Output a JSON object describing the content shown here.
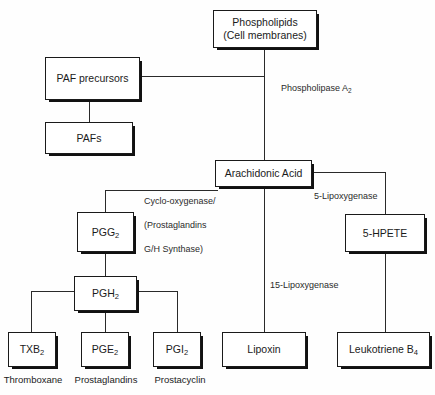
{
  "diagram": {
    "colors": {
      "background": "#fefefe",
      "box_fill": "#ffffff",
      "box_border": "#1a1a1a",
      "shadow": "#111111",
      "line": "#2a2a2a",
      "text": "#1b1b1b",
      "label_text": "#2b2b2b"
    }
  },
  "nodes": {
    "phospholipids": {
      "line1": "Phospholipids",
      "line2": "(Cell membranes)"
    },
    "paf_precursors": {
      "label": "PAF precursors"
    },
    "pafs": {
      "label": "PAFs"
    },
    "arachidonic_acid": {
      "label": "Arachidonic Acid"
    },
    "pgg2": {
      "base": "PGG",
      "sub": "2"
    },
    "pgh2": {
      "base": "PGH",
      "sub": "2"
    },
    "hpete": {
      "label": "5-HPETE"
    },
    "txb2": {
      "base": "TXB",
      "sub": "2"
    },
    "pge2": {
      "base": "PGE",
      "sub": "2"
    },
    "pgi2": {
      "base": "PGI",
      "sub": "2"
    },
    "lipoxin": {
      "label": "Lipoxin"
    },
    "leukotriene_b4": {
      "base": "Leukotriene B",
      "sub": "4"
    }
  },
  "enzyme_labels": {
    "phospholipase": {
      "base": "Phospholipase A",
      "sub": "2"
    },
    "cyclooxygenase": {
      "line1": "Cyclo-oxygenase/",
      "line2": "(Prostaglandins",
      "line3": "G/H Synthase)"
    },
    "lipoxygenase_5": {
      "label": "5-Lipoxygenase"
    },
    "lipoxygenase_15": {
      "label": "15-Lipoxygenase"
    }
  },
  "captions": {
    "thromboxane": "Thromboxane",
    "prostaglandins": "Prostaglandins",
    "prostacyclin": "Prostacyclin"
  }
}
